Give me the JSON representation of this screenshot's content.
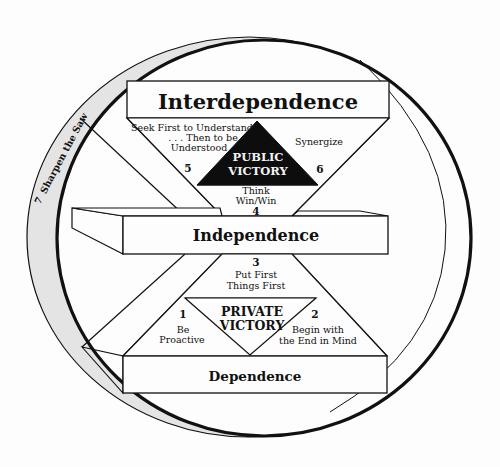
{
  "diagram": {
    "colors": {
      "line": "#111111",
      "ring_fill": "#e4e4e4",
      "background": "#fdfdfd",
      "public_victory_fill": "#0d0d0d",
      "public_victory_text": "#f2f2f2"
    },
    "levels": {
      "interdependence": "Interdependence",
      "independence": "Independence",
      "dependence": "Dependence"
    },
    "victories": {
      "public": {
        "line1": "PUBLIC",
        "line2": "VICTORY"
      },
      "private": {
        "line1": "PRIVATE",
        "line2": "VICTORY"
      }
    },
    "habits": [
      {
        "number": "1",
        "lines": [
          "Be",
          "Proactive"
        ]
      },
      {
        "number": "2",
        "lines": [
          "Begin with",
          "the End in Mind"
        ]
      },
      {
        "number": "3",
        "lines": [
          "Put First",
          "Things First"
        ]
      },
      {
        "number": "4",
        "lines": [
          "Think",
          "Win/Win"
        ]
      },
      {
        "number": "5",
        "lines": [
          "Seek First to Understand",
          ". . . Then to be",
          "Understood"
        ]
      },
      {
        "number": "6",
        "lines": [
          "Synergize"
        ]
      },
      {
        "number": "7",
        "lines": [
          "Sharpen the Saw"
        ]
      }
    ]
  }
}
